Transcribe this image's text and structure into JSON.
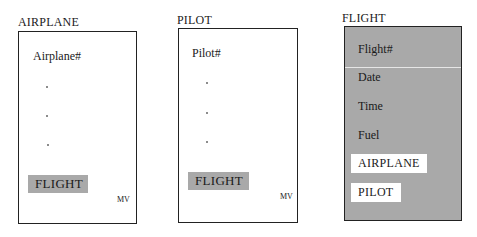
{
  "entities": [
    {
      "title": "AIRPLANE",
      "key_field": "Airplane#",
      "ellipsis_dots": 3,
      "link_label": "FLIGHT",
      "multivalue_label": "MV",
      "style": "white"
    },
    {
      "title": "PILOT",
      "key_field": "Pilot#",
      "ellipsis_dots": 3,
      "link_label": "FLIGHT",
      "multivalue_label": "MV",
      "style": "white"
    },
    {
      "title": "FLIGHT",
      "key_field": "Flight#",
      "fields": [
        "Date",
        "Time",
        "Fuel"
      ],
      "links": [
        "AIRPLANE",
        "PILOT"
      ],
      "style": "gray"
    }
  ],
  "colors": {
    "gray_fill": "#a9a9a9",
    "border": "#222222",
    "background": "#ffffff"
  }
}
